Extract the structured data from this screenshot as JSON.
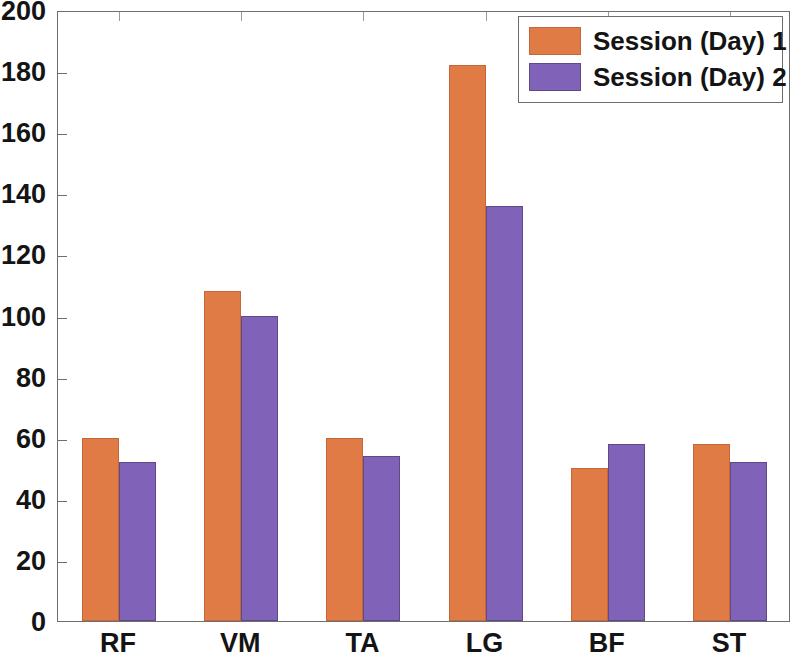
{
  "chart_data": {
    "type": "bar",
    "title": "",
    "subtitle": "",
    "xlabel": "",
    "ylabel": "",
    "categories": [
      "RF",
      "VM",
      "TA",
      "LG",
      "BF",
      "ST"
    ],
    "series": [
      {
        "name": "Session (Day) 1",
        "color": "#e07b46",
        "values": [
          60,
          108,
          60,
          182,
          50,
          58
        ]
      },
      {
        "name": "Session (Day) 2",
        "color": "#8062b8",
        "values": [
          52,
          100,
          54,
          136,
          58,
          52
        ]
      }
    ],
    "ylim": [
      0,
      200
    ],
    "ytick_labels": [
      "0",
      "20",
      "40",
      "60",
      "80",
      "100",
      "120",
      "140",
      "160",
      "180",
      "200"
    ],
    "ytick_values": [
      0,
      20,
      40,
      60,
      80,
      100,
      120,
      140,
      160,
      180,
      200
    ],
    "xtick_labels": [
      "RF",
      "VM",
      "TA",
      "LG",
      "BF",
      "ST"
    ],
    "grid": false,
    "legend_position": "top-right",
    "legend_entries": [
      "Session (Day) 1",
      "Session (Day) 2"
    ],
    "annotations": []
  },
  "legend": {
    "entry_0_label": "Session (Day) 1",
    "entry_1_label": "Session (Day) 2"
  },
  "axes": {
    "y_labels": [
      "0",
      "20",
      "40",
      "60",
      "80",
      "100",
      "120",
      "140",
      "160",
      "180",
      "200"
    ],
    "x_labels": [
      "RF",
      "VM",
      "TA",
      "LG",
      "BF",
      "ST"
    ]
  }
}
